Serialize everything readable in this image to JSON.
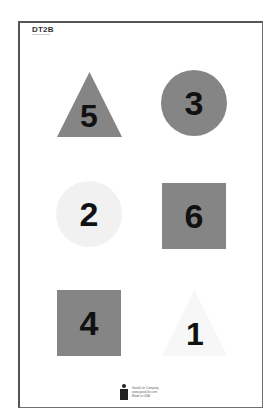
{
  "header": {
    "code": "DT2B"
  },
  "colors": {
    "dark_gray": "#858585",
    "light_gray": "#f1f1f1",
    "very_light": "#f7f7f7",
    "number_color": "#111111",
    "frame": "#555555"
  },
  "shapes": [
    {
      "type": "triangle",
      "number": "5",
      "fill": "dark_gray",
      "position": "top-left"
    },
    {
      "type": "circle",
      "number": "3",
      "fill": "dark_gray",
      "position": "top-right"
    },
    {
      "type": "circle",
      "number": "2",
      "fill": "light_gray",
      "position": "middle-left"
    },
    {
      "type": "square",
      "number": "6",
      "fill": "dark_gray",
      "position": "middle-right"
    },
    {
      "type": "square",
      "number": "4",
      "fill": "dark_gray",
      "position": "bottom-left"
    },
    {
      "type": "triangle",
      "number": "1",
      "fill": "very_light",
      "position": "bottom-right"
    }
  ],
  "footer": {
    "logo": "person-logo-icon",
    "lines": [
      "Good-Lite Company",
      "www.good-lite.com",
      "Made in USA"
    ]
  }
}
